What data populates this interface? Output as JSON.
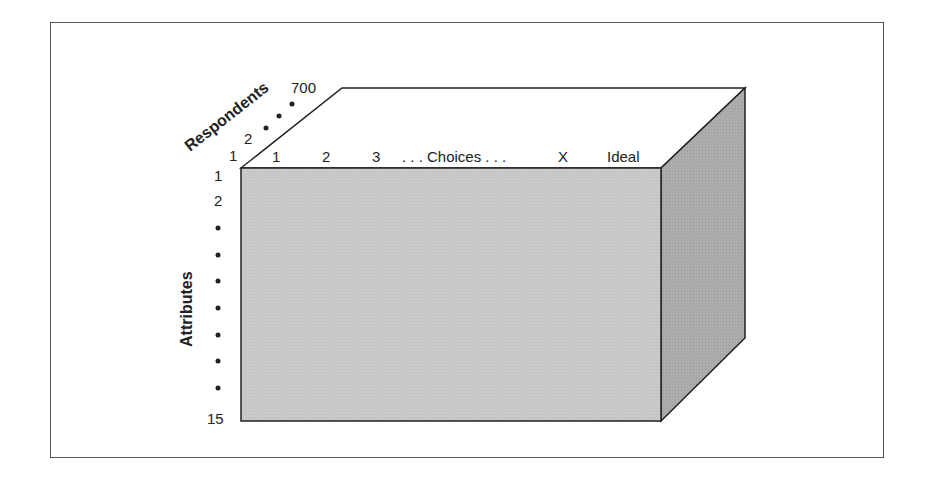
{
  "diagram": {
    "type": "3d-data-cube",
    "respondents_axis": {
      "title": "Respondents",
      "start": "1",
      "second": "2",
      "end": "700"
    },
    "choices_axis": {
      "labels": [
        "1",
        "2",
        "3",
        ". . . Choices . . .",
        "X",
        "Ideal"
      ]
    },
    "attributes_axis": {
      "title": "Attributes",
      "start": "1",
      "second": "2",
      "end": "15"
    },
    "colors": {
      "front_face": "#c8c8c8",
      "side_face": "#a9a9a9",
      "top_face": "#ffffff",
      "edge": "#222222",
      "frame": "#555555"
    }
  }
}
